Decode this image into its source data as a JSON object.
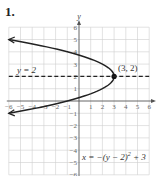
{
  "problem_number": "1.",
  "chart_data": {
    "type": "line",
    "title": "",
    "xlabel": "",
    "ylabel": "y",
    "xlim": [
      -6,
      6
    ],
    "ylim": [
      -6,
      6
    ],
    "grid": true,
    "x_ticks": [
      -6,
      -5,
      -4,
      -3,
      -2,
      -1,
      1,
      2,
      3,
      4,
      5,
      6
    ],
    "y_ticks": [
      -6,
      -5,
      -4,
      -3,
      -2,
      -1,
      1,
      2,
      3,
      4,
      5,
      6
    ],
    "series": [
      {
        "name": "x = -(y - 2)^2 + 3",
        "kind": "parabola",
        "equation": "x = -(y - 2)^2 + 3",
        "points": [
          {
            "x": -6,
            "y": 5
          },
          {
            "x": -3.25,
            "y": 4.5
          },
          {
            "x": -1,
            "y": 4
          },
          {
            "x": 0.75,
            "y": 3.5
          },
          {
            "x": 2,
            "y": 3
          },
          {
            "x": 2.75,
            "y": 2.5
          },
          {
            "x": 3,
            "y": 2
          },
          {
            "x": 2.75,
            "y": 1.5
          },
          {
            "x": 2,
            "y": 1
          },
          {
            "x": 0.75,
            "y": 0.5
          },
          {
            "x": -1,
            "y": 0
          },
          {
            "x": -3.25,
            "y": -0.5
          },
          {
            "x": -6,
            "y": -1
          }
        ],
        "style": "solid",
        "arrows": "both-ends"
      },
      {
        "name": "y = 2",
        "kind": "horizontal-line",
        "equation": "y = 2",
        "points": [
          {
            "x": -6,
            "y": 2
          },
          {
            "x": 6,
            "y": 2
          }
        ],
        "style": "dashed"
      }
    ],
    "annotations": [
      {
        "text": "(3, 2)",
        "x": 3,
        "y": 2,
        "role": "vertex-label"
      },
      {
        "text": "y = 2",
        "role": "axis-of-symmetry-label"
      },
      {
        "text": "x = −(y − 2)² + 3",
        "role": "equation-label"
      }
    ]
  },
  "labels": {
    "y_axis": "y",
    "vertex": "(3, 2)",
    "axis_of_symmetry": "y = 2",
    "equation_main": "x = −(y − 2)",
    "equation_exp": "2",
    "equation_tail": " + 3"
  }
}
